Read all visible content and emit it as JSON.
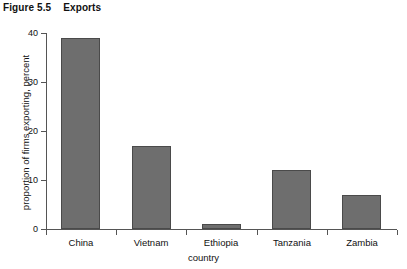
{
  "caption": {
    "figure_number": "Figure 5.5",
    "title": "Exports"
  },
  "chart_data": {
    "type": "bar",
    "title": "Exports",
    "categories": [
      "China",
      "Vietnam",
      "Ethiopia",
      "Tanzania",
      "Zambia"
    ],
    "values": [
      39,
      17,
      1,
      12,
      7
    ],
    "xlabel": "country",
    "ylabel": "proportion of firms exporting, percent",
    "ylim": [
      0,
      40
    ],
    "yticks": [
      0,
      10,
      20,
      30,
      40
    ],
    "ytick_labels": [
      "0",
      "10",
      "20",
      "30",
      "40"
    ],
    "grid": false,
    "legend": false,
    "bar_color": "#6e6e6e",
    "bar_edge_color": "#4a4a4a",
    "axis_color": "#555555",
    "background": "#ffffff"
  }
}
